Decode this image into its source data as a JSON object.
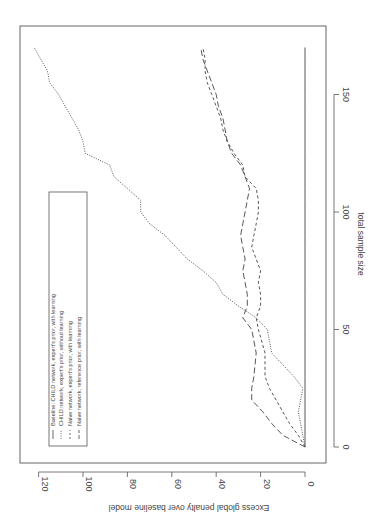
{
  "chart_data": {
    "type": "line",
    "orientation": "rotated-90-clockwise",
    "title": "",
    "xlabel": "total sample size",
    "ylabel": "Excess global penalty over baseline model",
    "xlim": [
      -5,
      175
    ],
    "ylim": [
      -8,
      128
    ],
    "x_ticks": [
      0,
      50,
      100,
      150
    ],
    "y_ticks": [
      0,
      20,
      40,
      60,
      80,
      100,
      120
    ],
    "grid": false,
    "legend_position": "upper left",
    "x": [
      0,
      5,
      10,
      15,
      20,
      25,
      30,
      40,
      50,
      55,
      60,
      65,
      70,
      75,
      80,
      85,
      90,
      95,
      100,
      105,
      110,
      115,
      120,
      125,
      130,
      135,
      140,
      145,
      150,
      155,
      160,
      165,
      170
    ],
    "series": [
      {
        "name": "Baseline: CHILD network, expert's prior, with learning",
        "style": "solid",
        "values": [
          0,
          0,
          0,
          0,
          0,
          0,
          0,
          0,
          0,
          0,
          0,
          0,
          0,
          0,
          0,
          0,
          0,
          0,
          0,
          0,
          0,
          0,
          0,
          0,
          0,
          0,
          0,
          0,
          0,
          0,
          0,
          0,
          0
        ]
      },
      {
        "name": "CHILD network, expert's prior, without learning",
        "style": "dotted",
        "values": [
          0,
          1,
          2,
          3,
          2,
          1,
          5,
          15,
          17,
          22,
          30,
          37,
          40,
          46,
          53,
          58,
          63,
          70,
          74,
          74,
          80,
          86,
          88,
          99,
          100,
          102,
          105,
          108,
          111,
          115,
          116,
          119,
          122
        ]
      },
      {
        "name": "Naive network, expert's prior, with learning",
        "style": "dashed-short",
        "values": [
          0,
          3,
          7,
          10,
          13,
          16,
          18,
          18,
          21,
          22,
          20,
          20,
          21,
          20,
          22,
          24,
          23,
          22,
          21,
          21,
          22,
          27,
          28,
          32,
          35,
          37,
          38,
          40,
          42,
          44,
          45,
          45,
          46
        ]
      },
      {
        "name": "Naive network, reference prior, with learning",
        "style": "dashed-long",
        "values": [
          0,
          10,
          15,
          19,
          24,
          24,
          23,
          22,
          24,
          28,
          26,
          26,
          27,
          28,
          27,
          28,
          29,
          28,
          27,
          26,
          25,
          27,
          29,
          33,
          35,
          36,
          37,
          39,
          40,
          42,
          44,
          46,
          47
        ]
      }
    ],
    "legend_entries": [
      "Baseline: CHILD network, expert's prior, with learning",
      "CHILD network, expert's prior, without learning",
      "Naive network, expert's prior, with learning",
      "Naive network, reference prior, with learning"
    ]
  },
  "axes": {
    "xlabel": "total sample size",
    "ylabel": "Excess global penalty over baseline model",
    "x_tick_labels": [
      "0",
      "50",
      "100",
      "150"
    ],
    "y_tick_labels": [
      "0",
      "20",
      "40",
      "60",
      "80",
      "100",
      "120"
    ]
  },
  "legend": {
    "items": [
      "Baseline: CHILD network, expert's prior, with learning",
      "CHILD network, expert's prior, without learning",
      "Naive network, expert's prior, with learning",
      "Naive network, reference prior, with learning"
    ]
  },
  "colors": {
    "line": "#444444",
    "frame": "#555555",
    "text": "#444444"
  }
}
